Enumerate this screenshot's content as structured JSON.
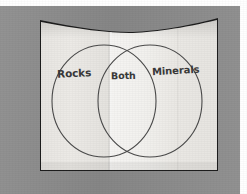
{
  "image": {
    "kind": "photographed-worksheet",
    "subject": "venn-diagram",
    "width": 247,
    "height": 194
  },
  "colors": {
    "backdrop_gray": "#8d8d8d",
    "paper_white": "#f0efed",
    "paper_shadow": "#dddbd7",
    "frame_dark": "#1d1d1d",
    "ink": "#3a3a3a",
    "margin_white": "#ffffff"
  },
  "diagram": {
    "type": "venn",
    "set_count": 2,
    "labels": {
      "left": "Rocks",
      "overlap": "Both",
      "right": "Minerals"
    },
    "circles": [
      {
        "id": "left-circle",
        "label": "Rocks",
        "cx": 104,
        "cy": 101,
        "rx": 52,
        "ry": 56
      },
      {
        "id": "right-circle",
        "label": "Minerals",
        "cx": 150,
        "cy": 101,
        "rx": 52,
        "ry": 56
      }
    ]
  },
  "paper": {
    "has_fold_crease": true,
    "fold_crease_x": 112,
    "top_edge": "curved-sagging"
  }
}
